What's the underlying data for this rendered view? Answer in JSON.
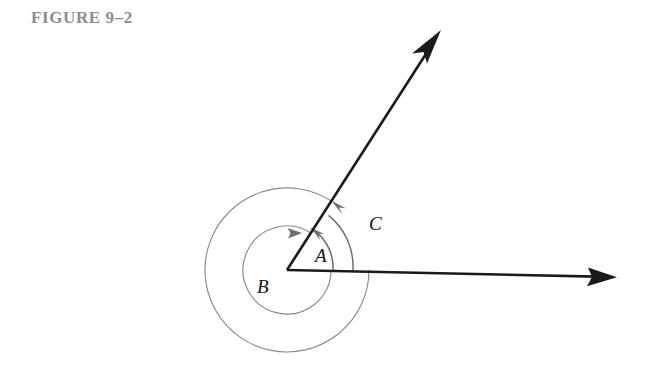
{
  "figure": {
    "title": "FIGURE 9–2",
    "title_color": "#8d8d8d"
  },
  "diagram": {
    "type": "geometry-angle-diagram",
    "vertex": {
      "x": 287,
      "y": 270,
      "label": ""
    },
    "rays": [
      {
        "name": "horizontal-ray",
        "from": {
          "x": 287,
          "y": 270
        },
        "to": {
          "x": 615,
          "y": 277
        },
        "arrowhead": "end",
        "color": "#1a1a1a"
      },
      {
        "name": "upper-ray",
        "from": {
          "x": 287,
          "y": 270
        },
        "to": {
          "x": 440,
          "y": 32
        },
        "arrowhead": "end",
        "color": "#1a1a1a"
      }
    ],
    "arcs": [
      {
        "name": "arc-A",
        "label": "A",
        "radius": 46,
        "start_deg": 0,
        "end_deg": 57,
        "direction": "counterclockwise",
        "arrowhead": "end",
        "color": "#6f6f6f"
      },
      {
        "name": "arc-C",
        "label": "C",
        "radius": 66,
        "start_deg": 0,
        "end_deg": 57,
        "direction": "counterclockwise",
        "arrowhead": "end",
        "color": "#6f6f6f"
      },
      {
        "name": "arc-B-reflex-inner",
        "label": "B",
        "radius": 44,
        "start_deg": 0,
        "end_deg": 57,
        "sweep_deg": 303,
        "direction": "clockwise-reflex",
        "arrowhead": "end",
        "color": "#8a8a8a"
      },
      {
        "name": "arc-outer-reflex",
        "label": "",
        "radius": 82,
        "start_deg": 0,
        "end_deg": 57,
        "sweep_deg": 303,
        "direction": "clockwise-reflex",
        "arrowhead": "none",
        "color": "#8a8a8a"
      }
    ],
    "labels": [
      {
        "name": "label-A",
        "text": "A",
        "x": 315,
        "y": 262
      },
      {
        "name": "label-B",
        "text": "B",
        "x": 257,
        "y": 293
      },
      {
        "name": "label-C",
        "text": "C",
        "x": 369,
        "y": 230
      }
    ],
    "colors": {
      "ray": "#1a1a1a",
      "arc": "#8a8a8a",
      "arc_emphasis": "#6f6f6f",
      "background": "#ffffff"
    }
  }
}
